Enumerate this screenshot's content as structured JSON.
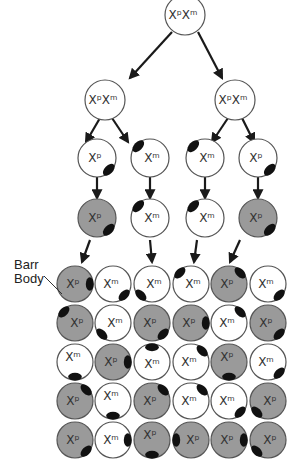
{
  "diagram": {
    "colors": {
      "paternal_fill": "#9a9a9a",
      "maternal_fill": "#ffffff",
      "outline": "#555555",
      "barr_body": "#111111",
      "arrow": "#1a1a1a"
    },
    "labels": {
      "paternal": "Xᵖ",
      "maternal": "Xᵐ",
      "zygote": "XᵖXᵐ",
      "barr_body_line1": "Barr",
      "barr_body_line2": "Body"
    },
    "tree": [
      {
        "id": "zygote",
        "x": 185,
        "y": 15,
        "type": "both"
      },
      {
        "id": "l2a",
        "x": 105,
        "y": 100,
        "type": "both"
      },
      {
        "id": "l2b",
        "x": 235,
        "y": 100,
        "type": "both"
      },
      {
        "id": "l3a",
        "x": 97,
        "y": 158,
        "type": "p",
        "active_fill": false,
        "barr": "br"
      },
      {
        "id": "l3b",
        "x": 150,
        "y": 158,
        "type": "m",
        "active_fill": false,
        "barr": "tl"
      },
      {
        "id": "l3c",
        "x": 205,
        "y": 158,
        "type": "m",
        "active_fill": false,
        "barr": "tl"
      },
      {
        "id": "l3d",
        "x": 258,
        "y": 158,
        "type": "p",
        "active_fill": false,
        "barr": "br"
      },
      {
        "id": "l4a",
        "x": 97,
        "y": 218,
        "type": "p",
        "active_fill": true,
        "barr": "br"
      },
      {
        "id": "l4b",
        "x": 150,
        "y": 218,
        "type": "m",
        "active_fill": false,
        "barr": "tl"
      },
      {
        "id": "l4c",
        "x": 205,
        "y": 218,
        "type": "m",
        "active_fill": false,
        "barr": "tl"
      },
      {
        "id": "l4d",
        "x": 258,
        "y": 218,
        "type": "p",
        "active_fill": true,
        "barr": "br"
      }
    ],
    "grid": {
      "columns_x": [
        75,
        113,
        152,
        191,
        229,
        268
      ],
      "rows_y": [
        284,
        323,
        362,
        401,
        440
      ],
      "cells": [
        [
          {
            "t": "p",
            "b": "r"
          },
          {
            "t": "m",
            "b": "br"
          },
          {
            "t": "m",
            "b": "bl"
          },
          {
            "t": "m",
            "b": "tl"
          },
          {
            "t": "p",
            "b": "tr"
          },
          {
            "t": "m",
            "b": "br"
          }
        ],
        [
          {
            "t": "p",
            "b": "tl"
          },
          {
            "t": "m",
            "b": "bl"
          },
          {
            "t": "p",
            "b": "br"
          },
          {
            "t": "p",
            "b": "r"
          },
          {
            "t": "m",
            "b": "tr"
          },
          {
            "t": "p",
            "b": "br"
          }
        ],
        [
          {
            "t": "m",
            "b": "b"
          },
          {
            "t": "p",
            "b": "r"
          },
          {
            "t": "m",
            "b": "t"
          },
          {
            "t": "m",
            "b": "tr"
          },
          {
            "t": "p",
            "b": "b"
          },
          {
            "t": "m",
            "b": "br"
          }
        ],
        [
          {
            "t": "p",
            "b": "tr"
          },
          {
            "t": "m",
            "b": "b"
          },
          {
            "t": "p",
            "b": "tr"
          },
          {
            "t": "m",
            "b": "tr"
          },
          {
            "t": "m",
            "b": "br"
          },
          {
            "t": "p",
            "b": "bl"
          }
        ],
        [
          {
            "t": "p",
            "b": "br"
          },
          {
            "t": "m",
            "b": "r"
          },
          {
            "t": "p",
            "b": "b"
          },
          {
            "t": "p",
            "b": "l"
          },
          {
            "t": "p",
            "b": "r"
          },
          {
            "t": "p",
            "b": "bl"
          }
        ]
      ]
    },
    "arrows": [
      [
        172,
        32,
        130,
        78
      ],
      [
        198,
        32,
        222,
        78
      ],
      [
        100,
        118,
        86,
        142
      ],
      [
        112,
        118,
        128,
        142
      ],
      [
        228,
        118,
        212,
        142
      ],
      [
        242,
        118,
        254,
        142
      ],
      [
        97,
        177,
        97,
        198
      ],
      [
        150,
        177,
        150,
        198
      ],
      [
        205,
        177,
        205,
        198
      ],
      [
        258,
        177,
        258,
        198
      ],
      [
        90,
        240,
        82,
        262
      ],
      [
        150,
        240,
        152,
        262
      ],
      [
        197,
        240,
        194,
        262
      ],
      [
        240,
        240,
        230,
        262
      ]
    ],
    "callout": {
      "label_x": 14,
      "label_y": 258,
      "line": [
        44,
        276,
        62,
        294
      ]
    }
  }
}
